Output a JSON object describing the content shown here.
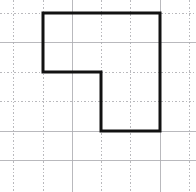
{
  "figure": {
    "title": "Notched rectangle outlined on dotted grid paper",
    "canvas": {
      "width": 196,
      "height": 192,
      "background_color": "#ffffff"
    },
    "grid": {
      "description": "Square dotted grid paper",
      "spacing_px": 29.4,
      "minor_color": "#b9b9bd",
      "major_color": "#a2a2a6",
      "vertical_lines_x": [
        13,
        43,
        72,
        101,
        130,
        160,
        189
      ],
      "horizontal_lines_y": [
        13,
        42,
        72,
        101,
        131,
        160
      ],
      "solid_vertical_lines_x": [
        72,
        160
      ],
      "solid_horizontal_lines_y": [
        42,
        131,
        160
      ],
      "columns": 6,
      "rows": 5,
      "style": "dotted"
    },
    "shape": {
      "name": "notched-rectangle",
      "type": "polygon",
      "sides": 6,
      "stroke_color": "#121212",
      "stroke_width_px": 3,
      "fill": "none",
      "vertices_px": [
        [
          43,
          13
        ],
        [
          160,
          13
        ],
        [
          160,
          131
        ],
        [
          101,
          131
        ],
        [
          101,
          72
        ],
        [
          43,
          72
        ]
      ],
      "vertices_grid_units": [
        [
          1,
          0
        ],
        [
          5,
          0
        ],
        [
          5,
          4
        ],
        [
          3,
          4
        ],
        [
          3,
          2
        ],
        [
          1,
          2
        ]
      ],
      "points_attr": "43,13 160,13 160,131 101,131 101,72 43,72 43,13",
      "edges": [
        {
          "name": "top-edge",
          "from": [
            43,
            13
          ],
          "to": [
            160,
            13
          ],
          "orientation": "horizontal",
          "length_units": 4
        },
        {
          "name": "right-edge",
          "from": [
            160,
            13
          ],
          "to": [
            160,
            131
          ],
          "orientation": "vertical",
          "length_units": 4
        },
        {
          "name": "bottom-edge",
          "from": [
            160,
            131
          ],
          "to": [
            101,
            131
          ],
          "orientation": "horizontal",
          "length_units": 2
        },
        {
          "name": "inner-vertical-edge",
          "from": [
            101,
            131
          ],
          "to": [
            101,
            72
          ],
          "orientation": "vertical",
          "length_units": 2
        },
        {
          "name": "inner-horizontal-edge",
          "from": [
            101,
            72
          ],
          "to": [
            43,
            72
          ],
          "orientation": "horizontal",
          "length_units": 2
        },
        {
          "name": "left-edge",
          "from": [
            43,
            72
          ],
          "to": [
            43,
            13
          ],
          "orientation": "vertical",
          "length_units": 2
        }
      ]
    }
  }
}
